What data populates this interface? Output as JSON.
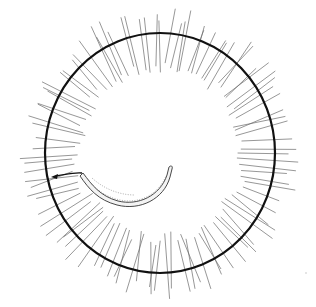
{
  "figure": {
    "title": "",
    "colors": {
      "background": "#ffffff",
      "outline": "#111111",
      "cilia": "#6a6a6a"
    },
    "components": [
      {
        "id": "cell-wall",
        "label": "circular membrane"
      },
      {
        "id": "cilia",
        "label": "radiating cilia",
        "count": 96
      },
      {
        "id": "inner-body",
        "label": "curved rod-shaped inner body"
      },
      {
        "id": "flagellum-arrow",
        "label": "arrow pointing left"
      }
    ]
  }
}
